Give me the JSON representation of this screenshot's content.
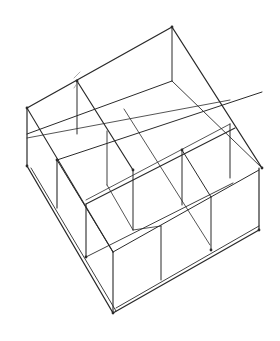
{
  "figure": {
    "title": "",
    "stroke_color": "#2a2a2a",
    "light_stroke_color": "#777777",
    "background": "#ffffff"
  },
  "lines": [
    {
      "x1": 27,
      "y1": 108,
      "x2": 172,
      "y2": 27,
      "w": 1.3
    },
    {
      "x1": 172,
      "y1": 27,
      "x2": 262,
      "y2": 168,
      "w": 1.3
    },
    {
      "x1": 27,
      "y1": 108,
      "x2": 113,
      "y2": 252,
      "w": 1.1
    },
    {
      "x1": 27,
      "y1": 108,
      "x2": 27,
      "y2": 166,
      "w": 1.2
    },
    {
      "x1": 172,
      "y1": 27,
      "x2": 172,
      "y2": 81,
      "w": 1.0
    },
    {
      "x1": 27,
      "y1": 166,
      "x2": 113,
      "y2": 313,
      "w": 1.3
    },
    {
      "x1": 31,
      "y1": 168,
      "x2": 116,
      "y2": 311,
      "w": 0.9
    },
    {
      "x1": 113,
      "y1": 313,
      "x2": 259,
      "y2": 230,
      "w": 1.3
    },
    {
      "x1": 116,
      "y1": 308,
      "x2": 259,
      "y2": 226,
      "w": 0.9
    },
    {
      "x1": 259,
      "y1": 168,
      "x2": 259,
      "y2": 230,
      "w": 1.2
    },
    {
      "x1": 77,
      "y1": 81,
      "x2": 77,
      "y2": 134,
      "w": 1.0
    },
    {
      "x1": 77,
      "y1": 81,
      "x2": 133,
      "y2": 170,
      "w": 1.2
    },
    {
      "x1": 27,
      "y1": 134,
      "x2": 172,
      "y2": 81,
      "w": 1.0
    },
    {
      "x1": 27,
      "y1": 138,
      "x2": 230,
      "y2": 100,
      "w": 0.8
    },
    {
      "x1": 57,
      "y1": 160,
      "x2": 262,
      "y2": 92,
      "w": 1.0
    },
    {
      "x1": 57,
      "y1": 160,
      "x2": 57,
      "y2": 208,
      "w": 1.1
    },
    {
      "x1": 57,
      "y1": 160,
      "x2": 113,
      "y2": 252,
      "w": 1.0
    },
    {
      "x1": 107,
      "y1": 131,
      "x2": 107,
      "y2": 185,
      "w": 0.9
    },
    {
      "x1": 172,
      "y1": 81,
      "x2": 262,
      "y2": 168,
      "w": 0.9
    },
    {
      "x1": 124,
      "y1": 109,
      "x2": 210,
      "y2": 245,
      "w": 0.8
    },
    {
      "x1": 86,
      "y1": 204,
      "x2": 235,
      "y2": 128,
      "w": 1.1
    },
    {
      "x1": 86,
      "y1": 200,
      "x2": 230,
      "y2": 124,
      "w": 0.8
    },
    {
      "x1": 86,
      "y1": 204,
      "x2": 86,
      "y2": 257,
      "w": 1.1
    },
    {
      "x1": 182,
      "y1": 150,
      "x2": 182,
      "y2": 205,
      "w": 1.0
    },
    {
      "x1": 182,
      "y1": 150,
      "x2": 211,
      "y2": 197,
      "w": 1.0
    },
    {
      "x1": 230,
      "y1": 124,
      "x2": 230,
      "y2": 178,
      "w": 1.0
    },
    {
      "x1": 133,
      "y1": 170,
      "x2": 133,
      "y2": 230,
      "w": 1.0
    },
    {
      "x1": 86,
      "y1": 257,
      "x2": 233,
      "y2": 183,
      "w": 0.9
    },
    {
      "x1": 113,
      "y1": 252,
      "x2": 113,
      "y2": 313,
      "w": 1.1
    },
    {
      "x1": 113,
      "y1": 252,
      "x2": 259,
      "y2": 170,
      "w": 1.0
    },
    {
      "x1": 211,
      "y1": 197,
      "x2": 211,
      "y2": 250,
      "w": 1.0
    },
    {
      "x1": 161,
      "y1": 226,
      "x2": 161,
      "y2": 280,
      "w": 1.0
    },
    {
      "x1": 133,
      "y1": 230,
      "x2": 161,
      "y2": 226,
      "w": 0.8
    },
    {
      "x1": 107,
      "y1": 185,
      "x2": 133,
      "y2": 230,
      "w": 0.8
    },
    {
      "x1": 74,
      "y1": 78,
      "x2": 80,
      "y2": 72,
      "w": 0.6
    },
    {
      "x1": 74,
      "y1": 88,
      "x2": 78,
      "y2": 82,
      "w": 0.6
    }
  ],
  "vertices": [
    {
      "x": 172,
      "y": 27
    },
    {
      "x": 27,
      "y": 108
    },
    {
      "x": 77,
      "y": 81
    },
    {
      "x": 27,
      "y": 166
    },
    {
      "x": 262,
      "y": 168
    },
    {
      "x": 113,
      "y": 313
    },
    {
      "x": 259,
      "y": 230
    },
    {
      "x": 182,
      "y": 150
    },
    {
      "x": 57,
      "y": 160
    },
    {
      "x": 86,
      "y": 257
    },
    {
      "x": 211,
      "y": 250
    },
    {
      "x": 133,
      "y": 170
    }
  ]
}
